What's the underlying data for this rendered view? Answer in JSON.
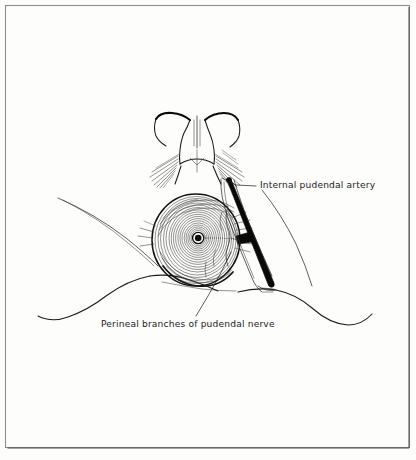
{
  "figure": {
    "background_color": "#fdfdfc",
    "ink_color": "#121212",
    "frame_color": "#8d8d8d"
  },
  "labels": {
    "artery": {
      "text": "Internal pudendal artery",
      "x": 260,
      "y": 188
    },
    "nerve": {
      "text": "Perineal branches of pudendal nerve",
      "x": 101,
      "y": 327
    }
  },
  "structures": {
    "anal_sphincter": {
      "name": "external anal sphincter",
      "center_x": 196,
      "center_y": 240,
      "radius_x": 44,
      "radius_y": 46,
      "ring_count": 22
    },
    "anal_orifice": {
      "name": "anal orifice",
      "center_x": 198,
      "center_y": 238,
      "radius": 4
    },
    "internal_pudendal_artery": {
      "name": "internal pudendal artery",
      "color": "#090909",
      "start_x": 228,
      "start_y": 181,
      "end_x": 272,
      "end_y": 284
    },
    "vulva": {
      "name": "vulva and labia",
      "top_y": 112,
      "bottom_y": 170
    }
  }
}
